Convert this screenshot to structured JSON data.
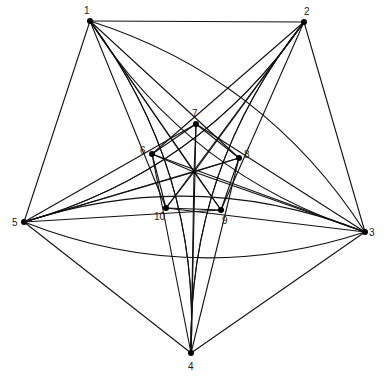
{
  "diagram": {
    "type": "graph",
    "vertices": [
      {
        "id": "1",
        "x": 90,
        "y": 21,
        "label": "1",
        "lx": -6,
        "ly": -7
      },
      {
        "id": "2",
        "x": 304,
        "y": 22,
        "label": "2",
        "lx": 0,
        "ly": -7
      },
      {
        "id": "3",
        "x": 365,
        "y": 232,
        "label": "3",
        "lx": 4,
        "ly": 4
      },
      {
        "id": "4",
        "x": 191,
        "y": 353,
        "label": "4",
        "lx": -3,
        "ly": 17
      },
      {
        "id": "5",
        "x": 24,
        "y": 222,
        "label": "5",
        "lx": -12,
        "ly": 4
      },
      {
        "id": "6",
        "x": 152,
        "y": 154,
        "label": "6",
        "lx": -12,
        "ly": 0
      },
      {
        "id": "7",
        "x": 196,
        "y": 124,
        "label": "7",
        "lx": -4,
        "ly": -7
      },
      {
        "id": "8",
        "x": 239,
        "y": 158,
        "label": "8",
        "lx": 5,
        "ly": 0
      },
      {
        "id": "9",
        "x": 221,
        "y": 210,
        "label": "9",
        "lx": 1,
        "ly": 14
      },
      {
        "id": "10",
        "x": 166,
        "y": 208,
        "label": "10",
        "lx": -12,
        "ly": 12
      },
      {
        "id": "c",
        "x": 194,
        "y": 172,
        "label": "",
        "lx": 0,
        "ly": 0
      }
    ],
    "straight_edges": [
      [
        "1",
        "2"
      ],
      [
        "2",
        "3"
      ],
      [
        "3",
        "4"
      ],
      [
        "4",
        "5"
      ],
      [
        "5",
        "1"
      ],
      [
        "6",
        "7"
      ],
      [
        "7",
        "8"
      ],
      [
        "8",
        "9"
      ],
      [
        "9",
        "10"
      ],
      [
        "10",
        "6"
      ],
      [
        "c",
        "6"
      ],
      [
        "c",
        "7"
      ],
      [
        "c",
        "8"
      ],
      [
        "c",
        "9"
      ],
      [
        "c",
        "10"
      ],
      [
        "1",
        "c"
      ],
      [
        "2",
        "c"
      ],
      [
        "3",
        "c"
      ],
      [
        "4",
        "c"
      ],
      [
        "5",
        "c"
      ],
      [
        "1",
        "9"
      ],
      [
        "1",
        "8"
      ],
      [
        "1",
        "10"
      ],
      [
        "2",
        "6"
      ],
      [
        "2",
        "10"
      ],
      [
        "2",
        "9"
      ],
      [
        "3",
        "7"
      ],
      [
        "3",
        "6"
      ],
      [
        "3",
        "10"
      ],
      [
        "4",
        "8"
      ],
      [
        "4",
        "7"
      ],
      [
        "4",
        "6"
      ],
      [
        "5",
        "9"
      ],
      [
        "5",
        "8"
      ],
      [
        "5",
        "7"
      ]
    ],
    "curved_edges": [
      {
        "from": "1",
        "to": "3",
        "bend": 0.18
      },
      {
        "from": "1",
        "to": "4",
        "bend": -0.18
      },
      {
        "from": "2",
        "to": "4",
        "bend": 0.18
      },
      {
        "from": "2",
        "to": "5",
        "bend": -0.18
      },
      {
        "from": "3",
        "to": "5",
        "bend": 0.18
      },
      {
        "from": "3",
        "to": "1",
        "bend": 0.18
      },
      {
        "from": "4",
        "to": "1",
        "bend": 0.18
      },
      {
        "from": "4",
        "to": "2",
        "bend": -0.18
      },
      {
        "from": "5",
        "to": "2",
        "bend": 0.18
      },
      {
        "from": "5",
        "to": "3",
        "bend": 0.18
      }
    ]
  }
}
